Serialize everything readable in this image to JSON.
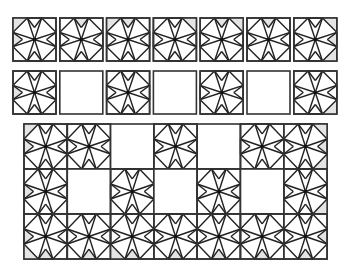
{
  "puzzle": {
    "title": "",
    "colors": {
      "line": "#222222",
      "border": "#333333",
      "shade": "#e4e4e4",
      "background": "#ffffff"
    },
    "tile_glyph": "octagram-pinwheel-tile",
    "row1": {
      "y": 18,
      "x0": 13,
      "step": 46.8,
      "size": 43,
      "tiles": [
        {
          "type": "pattern",
          "shaded": [
            "top-left",
            "left-top",
            "left-bottom"
          ]
        },
        {
          "type": "pattern",
          "shaded": [
            "top"
          ]
        },
        {
          "type": "pattern",
          "shaded": [
            "top-left",
            "top"
          ]
        },
        {
          "type": "pattern",
          "shaded": [
            "top-right"
          ]
        },
        {
          "type": "pattern",
          "shaded": [
            "top",
            "top-right"
          ]
        },
        {
          "type": "pattern",
          "shaded": [
            "top"
          ]
        },
        {
          "type": "pattern",
          "shaded": [
            "top-right",
            "right-top",
            "right-bottom"
          ]
        }
      ]
    },
    "row2": {
      "y": 71,
      "x0": 13,
      "step": 46.8,
      "size": 43,
      "tiles": [
        {
          "type": "pattern",
          "shaded": [
            "left-bottom"
          ]
        },
        {
          "type": "blank",
          "shaded": []
        },
        {
          "type": "pattern",
          "shaded": []
        },
        {
          "type": "blank",
          "shaded": []
        },
        {
          "type": "pattern",
          "shaded": []
        },
        {
          "type": "blank",
          "shaded": []
        },
        {
          "type": "pattern",
          "shaded": [
            "right-bottom"
          ]
        }
      ]
    },
    "grid": {
      "x": 24,
      "y": 124,
      "cols": 7,
      "rows": 3,
      "cell_w": 43.3,
      "cell_h": 45,
      "cells": [
        [
          {
            "type": "pattern",
            "shaded": [
              "top-left",
              "left-top",
              "left-bottom"
            ]
          },
          {
            "type": "pattern",
            "shaded": []
          },
          {
            "type": "blank",
            "shaded": []
          },
          {
            "type": "pattern",
            "shaded": []
          },
          {
            "type": "blank",
            "shaded": []
          },
          {
            "type": "pattern",
            "shaded": []
          },
          {
            "type": "pattern",
            "shaded": [
              "top-right",
              "right-top",
              "right-bottom"
            ]
          }
        ],
        [
          {
            "type": "pattern",
            "shaded": [
              "left-bottom"
            ]
          },
          {
            "type": "blank",
            "shaded": []
          },
          {
            "type": "pattern",
            "shaded": []
          },
          {
            "type": "blank",
            "shaded": []
          },
          {
            "type": "pattern",
            "shaded": []
          },
          {
            "type": "blank",
            "shaded": []
          },
          {
            "type": "pattern",
            "shaded": [
              "right-bottom"
            ]
          }
        ],
        [
          {
            "type": "pattern",
            "shaded": [
              "left-top",
              "bottom-left",
              "bottom"
            ]
          },
          {
            "type": "pattern",
            "shaded": [
              "bottom"
            ]
          },
          {
            "type": "pattern",
            "shaded": [
              "bottom-left",
              "bottom"
            ]
          },
          {
            "type": "pattern",
            "shaded": [
              "bottom-right"
            ]
          },
          {
            "type": "pattern",
            "shaded": [
              "bottom",
              "bottom-right"
            ]
          },
          {
            "type": "pattern",
            "shaded": [
              "bottom"
            ]
          },
          {
            "type": "pattern",
            "shaded": [
              "right-top",
              "bottom-right",
              "bottom"
            ]
          }
        ]
      ]
    }
  }
}
